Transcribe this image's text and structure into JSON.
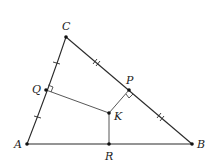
{
  "diagram": {
    "type": "geometry",
    "points": {
      "A": {
        "label": "A",
        "x": 27,
        "y": 144,
        "lx": 18,
        "ly": 148
      },
      "B": {
        "label": "B",
        "x": 192,
        "y": 144,
        "lx": 197,
        "ly": 148
      },
      "C": {
        "label": "C",
        "x": 66,
        "y": 37,
        "lx": 62,
        "ly": 30
      },
      "Q": {
        "label": "Q",
        "x": 46,
        "y": 90,
        "lx": 32,
        "ly": 93
      },
      "P": {
        "label": "P",
        "x": 129,
        "y": 90,
        "lx": 126,
        "ly": 84
      },
      "K": {
        "label": "K",
        "x": 109,
        "y": 113,
        "lx": 114,
        "ly": 120
      },
      "R": {
        "label": "R",
        "x": 109,
        "y": 144,
        "lx": 105,
        "ly": 160
      }
    },
    "segments": [
      {
        "from": "A",
        "to": "B"
      },
      {
        "from": "B",
        "to": "C"
      },
      {
        "from": "C",
        "to": "A"
      },
      {
        "from": "Q",
        "to": "K"
      },
      {
        "from": "P",
        "to": "K"
      },
      {
        "from": "K",
        "to": "R"
      }
    ],
    "congruence_marks": [
      {
        "segment": "CQ",
        "ticks": 1
      },
      {
        "segment": "QA",
        "ticks": 1
      },
      {
        "segment": "CP",
        "ticks": 2
      },
      {
        "segment": "PB",
        "ticks": 2
      }
    ],
    "right_angles": [
      "Q",
      "P"
    ]
  }
}
